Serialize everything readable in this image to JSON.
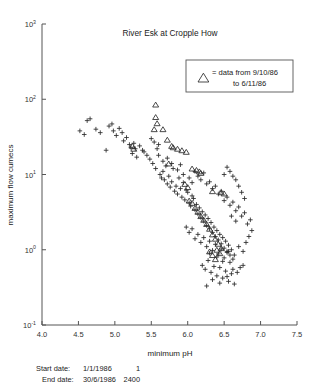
{
  "chart_data": {
    "type": "scatter",
    "title": "River Esk at Cropple How",
    "xlabel": "minimum pH",
    "ylabel": "maximum flow  cumecs",
    "xlim": [
      4.0,
      7.5
    ],
    "ylim": [
      0.1,
      1000
    ],
    "yscale": "log",
    "xscale": "linear",
    "grid": false,
    "xticks": [
      "4.0",
      "4.5",
      "5.0",
      "5.5",
      "6.0",
      "6.5",
      "7.0",
      "7.5"
    ],
    "xtick_values": [
      4.0,
      4.5,
      5.0,
      5.5,
      6.0,
      6.5,
      7.0,
      7.5
    ],
    "yticks": [
      "10³",
      "10²",
      "10¹",
      "10⁰",
      "10⁻¹"
    ],
    "ytick_values": [
      1000,
      100,
      10,
      1,
      0.1
    ],
    "ytick_mantissa": [
      "10",
      "10",
      "10",
      "10",
      "10"
    ],
    "ytick_exponent": [
      "3",
      "2",
      "1",
      "0",
      "-1"
    ],
    "legend_position": "upper-right",
    "series": [
      {
        "name": "all data",
        "marker": "plus",
        "color": "#2b2b2b",
        "points": [
          [
            4.52,
            38.0
          ],
          [
            4.58,
            34.0
          ],
          [
            4.62,
            52.0
          ],
          [
            4.66,
            55.0
          ],
          [
            4.74,
            40.0
          ],
          [
            4.8,
            36.0
          ],
          [
            4.88,
            21.0
          ],
          [
            4.92,
            44.0
          ],
          [
            4.96,
            47.0
          ],
          [
            4.98,
            38.0
          ],
          [
            5.02,
            33.0
          ],
          [
            5.06,
            41.0
          ],
          [
            5.1,
            36.0
          ],
          [
            5.12,
            28.0
          ],
          [
            5.16,
            31.0
          ],
          [
            5.2,
            25.0
          ],
          [
            5.22,
            23.0
          ],
          [
            5.24,
            19.0
          ],
          [
            5.26,
            26.0
          ],
          [
            5.28,
            22.0
          ],
          [
            5.3,
            17.0
          ],
          [
            5.34,
            24.0
          ],
          [
            5.38,
            21.0
          ],
          [
            5.4,
            20.0
          ],
          [
            5.44,
            18.0
          ],
          [
            5.48,
            16.0
          ],
          [
            5.52,
            14.0
          ],
          [
            5.56,
            12.0
          ],
          [
            5.6,
            25.0
          ],
          [
            5.62,
            10.0
          ],
          [
            5.64,
            9.0
          ],
          [
            5.66,
            11.0
          ],
          [
            5.68,
            8.5
          ],
          [
            5.7,
            13.0
          ],
          [
            5.72,
            7.5
          ],
          [
            5.74,
            9.5
          ],
          [
            5.76,
            6.8
          ],
          [
            5.78,
            8.0
          ],
          [
            5.8,
            12.0
          ],
          [
            5.82,
            6.0
          ],
          [
            5.84,
            7.0
          ],
          [
            5.86,
            5.5
          ],
          [
            5.88,
            9.0
          ],
          [
            5.9,
            6.5
          ],
          [
            5.92,
            5.0
          ],
          [
            5.94,
            7.8
          ],
          [
            5.96,
            4.6
          ],
          [
            5.98,
            6.2
          ],
          [
            6.0,
            5.8
          ],
          [
            6.02,
            4.2
          ],
          [
            6.04,
            3.8
          ],
          [
            6.06,
            5.2
          ],
          [
            6.08,
            4.8
          ],
          [
            6.1,
            3.4
          ],
          [
            6.12,
            4.0
          ],
          [
            6.14,
            3.0
          ],
          [
            6.16,
            3.6
          ],
          [
            6.18,
            2.7
          ],
          [
            6.2,
            3.2
          ],
          [
            6.22,
            2.4
          ],
          [
            6.24,
            2.9
          ],
          [
            6.26,
            2.1
          ],
          [
            6.28,
            2.6
          ],
          [
            6.3,
            1.9
          ],
          [
            6.32,
            2.3
          ],
          [
            6.34,
            1.7
          ],
          [
            6.36,
            2.0
          ],
          [
            6.38,
            1.5
          ],
          [
            6.4,
            1.8
          ],
          [
            6.42,
            1.35
          ],
          [
            6.44,
            1.6
          ],
          [
            6.46,
            1.2
          ],
          [
            6.48,
            1.45
          ],
          [
            6.5,
            1.05
          ],
          [
            6.52,
            1.3
          ],
          [
            6.54,
            0.95
          ],
          [
            6.56,
            1.15
          ],
          [
            6.58,
            0.85
          ],
          [
            6.6,
            1.0
          ],
          [
            6.62,
            0.75
          ],
          [
            6.1,
            11.0
          ],
          [
            6.14,
            9.5
          ],
          [
            6.18,
            8.5
          ],
          [
            6.22,
            10.5
          ],
          [
            6.26,
            7.5
          ],
          [
            6.3,
            8.0
          ],
          [
            6.34,
            6.5
          ],
          [
            6.38,
            7.0
          ],
          [
            6.42,
            5.5
          ],
          [
            6.46,
            6.0
          ],
          [
            6.5,
            4.5
          ],
          [
            6.54,
            5.0
          ],
          [
            6.58,
            3.9
          ],
          [
            6.62,
            4.3
          ],
          [
            6.66,
            3.3
          ],
          [
            6.7,
            3.7
          ],
          [
            6.74,
            2.8
          ],
          [
            6.78,
            3.1
          ],
          [
            6.82,
            2.2
          ],
          [
            6.86,
            2.5
          ],
          [
            5.98,
            2.0
          ],
          [
            6.02,
            1.7
          ],
          [
            6.06,
            1.9
          ],
          [
            6.1,
            1.4
          ],
          [
            6.14,
            1.6
          ],
          [
            6.18,
            1.25
          ],
          [
            6.22,
            1.45
          ],
          [
            6.26,
            1.1
          ],
          [
            6.3,
            1.3
          ],
          [
            6.34,
            0.98
          ],
          [
            6.38,
            1.18
          ],
          [
            6.42,
            0.88
          ],
          [
            6.46,
            1.02
          ],
          [
            6.5,
            0.78
          ],
          [
            6.54,
            0.92
          ],
          [
            6.58,
            0.68
          ],
          [
            6.2,
            0.62
          ],
          [
            6.24,
            0.55
          ],
          [
            6.28,
            0.72
          ],
          [
            6.32,
            0.5
          ],
          [
            6.36,
            0.6
          ],
          [
            6.4,
            0.45
          ],
          [
            6.44,
            0.58
          ],
          [
            6.48,
            0.42
          ],
          [
            6.52,
            0.52
          ],
          [
            6.56,
            0.38
          ],
          [
            6.6,
            0.48
          ],
          [
            6.64,
            0.35
          ],
          [
            6.26,
            0.33
          ],
          [
            6.34,
            0.4
          ],
          [
            6.44,
            0.36
          ],
          [
            6.54,
            0.44
          ],
          [
            6.62,
            0.55
          ],
          [
            6.68,
            0.5
          ],
          [
            6.72,
            0.58
          ],
          [
            6.76,
            0.62
          ],
          [
            6.3,
            0.9
          ],
          [
            6.4,
            0.8
          ],
          [
            6.48,
            0.7
          ],
          [
            6.56,
            0.95
          ],
          [
            6.64,
            0.85
          ],
          [
            6.7,
            1.1
          ],
          [
            6.76,
            0.95
          ],
          [
            6.8,
            1.25
          ],
          [
            6.84,
            1.5
          ],
          [
            6.88,
            1.8
          ],
          [
            6.6,
            2.8
          ],
          [
            6.66,
            2.4
          ],
          [
            5.6,
            18.0
          ],
          [
            5.66,
            15.0
          ],
          [
            5.72,
            16.5
          ],
          [
            5.78,
            14.0
          ],
          [
            5.5,
            30.0
          ],
          [
            5.54,
            27.0
          ],
          [
            5.58,
            22.0
          ],
          [
            5.86,
            11.5
          ],
          [
            6.02,
            9.0
          ],
          [
            6.06,
            7.8
          ],
          [
            5.94,
            10.0
          ],
          [
            5.9,
            13.5
          ],
          [
            6.7,
            7.0
          ],
          [
            6.74,
            5.8
          ],
          [
            6.78,
            4.8
          ],
          [
            6.66,
            8.5
          ],
          [
            6.62,
            9.5
          ],
          [
            6.58,
            11.0
          ],
          [
            6.54,
            12.5
          ],
          [
            6.5,
            10.0
          ]
        ]
      },
      {
        "name": "data from 9/10/86 to 6/11/86",
        "marker": "triangle",
        "color": "#2b2b2b",
        "points": [
          [
            5.56,
            85.0
          ],
          [
            5.56,
            58.0
          ],
          [
            5.58,
            48.0
          ],
          [
            5.54,
            40.0
          ],
          [
            5.66,
            40.0
          ],
          [
            5.72,
            29.0
          ],
          [
            5.78,
            24.0
          ],
          [
            5.8,
            23.0
          ],
          [
            5.86,
            22.0
          ],
          [
            5.92,
            21.0
          ],
          [
            5.98,
            20.0
          ],
          [
            5.74,
            14.0
          ],
          [
            6.06,
            12.0
          ],
          [
            6.12,
            11.5
          ],
          [
            6.16,
            11.0
          ],
          [
            6.18,
            10.5
          ],
          [
            5.24,
            24.0
          ],
          [
            5.26,
            22.0
          ],
          [
            6.34,
            6.0
          ],
          [
            6.46,
            5.8
          ],
          [
            6.5,
            5.6
          ],
          [
            6.02,
            4.5
          ],
          [
            6.06,
            4.2
          ],
          [
            6.1,
            3.6
          ],
          [
            6.14,
            3.2
          ],
          [
            6.18,
            2.8
          ],
          [
            6.22,
            2.5
          ],
          [
            6.26,
            2.2
          ],
          [
            6.3,
            1.9
          ],
          [
            6.34,
            1.6
          ],
          [
            6.38,
            1.4
          ],
          [
            6.42,
            1.2
          ],
          [
            6.46,
            1.05
          ],
          [
            6.3,
            0.95
          ],
          [
            6.34,
            0.85
          ],
          [
            6.38,
            0.75
          ],
          [
            5.96,
            7.5
          ],
          [
            6.0,
            6.8
          ],
          [
            6.4,
            1.0
          ],
          [
            6.44,
            0.9
          ]
        ]
      }
    ]
  },
  "legend": {
    "marker_label": "△",
    "equals": "=",
    "line1": "= data from 9/10/86",
    "line2": "to 6/11/86"
  },
  "footer": {
    "start_label": "Start date:",
    "start_date": "1/1/1986",
    "start_value": "1",
    "end_label": "End date:",
    "end_date": "30/6/1986",
    "end_value": "2400"
  }
}
